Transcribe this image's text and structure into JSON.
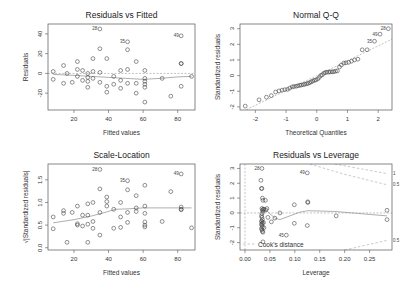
{
  "chart_data": [
    {
      "type": "scatter",
      "title": "Residuals vs Fitted",
      "xlabel": "Fitted values",
      "ylabel": "Residuals",
      "xlim": [
        5,
        90
      ],
      "ylim": [
        -37,
        50
      ],
      "xticks": [
        20,
        40,
        60,
        80
      ],
      "yticks": [
        -20,
        0,
        20,
        40
      ],
      "box": {
        "x": 48,
        "y": 24,
        "w": 147,
        "h": 86
      },
      "points": [
        [
          8,
          2
        ],
        [
          8,
          -6
        ],
        [
          14,
          8
        ],
        [
          14,
          -10
        ],
        [
          16,
          0
        ],
        [
          19,
          -9
        ],
        [
          22,
          12
        ],
        [
          22,
          4
        ],
        [
          22,
          -3
        ],
        [
          25,
          3
        ],
        [
          25,
          -7
        ],
        [
          28,
          0
        ],
        [
          28,
          -4
        ],
        [
          28,
          -8
        ],
        [
          28,
          -14
        ],
        [
          31,
          15
        ],
        [
          31,
          2
        ],
        [
          31,
          -5
        ],
        [
          35,
          25
        ],
        [
          35,
          1
        ],
        [
          35,
          -9
        ],
        [
          35,
          45
        ],
        [
          39,
          15
        ],
        [
          39,
          -13
        ],
        [
          39,
          -19
        ],
        [
          43,
          -3
        ],
        [
          43,
          -11
        ],
        [
          47,
          3
        ],
        [
          47,
          -7
        ],
        [
          47,
          -15
        ],
        [
          51,
          24
        ],
        [
          51,
          4
        ],
        [
          51,
          -10
        ],
        [
          51,
          32
        ],
        [
          56,
          12
        ],
        [
          56,
          -10
        ],
        [
          56,
          -20
        ],
        [
          61,
          3
        ],
        [
          61,
          -5
        ],
        [
          61,
          -8
        ],
        [
          61,
          -11
        ],
        [
          61,
          -14
        ],
        [
          61,
          -29
        ],
        [
          71,
          -5
        ],
        [
          76,
          -23
        ],
        [
          82,
          38
        ],
        [
          82,
          10
        ],
        [
          82,
          10
        ],
        [
          82,
          -13
        ],
        [
          88,
          -3
        ]
      ],
      "labels": [
        {
          "text": "28",
          "x": 35,
          "y": 45
        },
        {
          "text": "35",
          "x": 51,
          "y": 32
        },
        {
          "text": "49",
          "x": 82,
          "y": 38
        }
      ],
      "smooth": [
        [
          8,
          -1
        ],
        [
          20,
          -2
        ],
        [
          30,
          -3
        ],
        [
          40,
          -4
        ],
        [
          50,
          -5
        ],
        [
          60,
          -6
        ],
        [
          70,
          -5
        ],
        [
          80,
          -3.5
        ],
        [
          88,
          -3
        ]
      ],
      "refline": 0
    },
    {
      "type": "scatter",
      "title": "Normal Q-Q",
      "xlabel": "Theoretical Quantiles",
      "ylabel": "Standardized residuals",
      "xlim": [
        -2.5,
        2.45
      ],
      "ylim": [
        -2.2,
        3.3
      ],
      "xticks": [
        -2,
        -1,
        0,
        1,
        2
      ],
      "yticks": [
        -2,
        -1,
        0,
        1,
        2,
        3
      ],
      "box": {
        "x": 240,
        "y": 24,
        "w": 152,
        "h": 86
      },
      "points": [
        [
          -2.33,
          -1.95
        ],
        [
          -1.88,
          -1.55
        ],
        [
          -1.64,
          -1.38
        ],
        [
          -1.48,
          -1.28
        ],
        [
          -1.34,
          -1.05
        ],
        [
          -1.23,
          -0.98
        ],
        [
          -1.13,
          -0.93
        ],
        [
          -1.04,
          -0.9
        ],
        [
          -0.95,
          -0.88
        ],
        [
          -0.88,
          -0.8
        ],
        [
          -0.8,
          -0.72
        ],
        [
          -0.74,
          -0.7
        ],
        [
          -0.67,
          -0.68
        ],
        [
          -0.61,
          -0.65
        ],
        [
          -0.55,
          -0.62
        ],
        [
          -0.5,
          -0.6
        ],
        [
          -0.44,
          -0.58
        ],
        [
          -0.39,
          -0.55
        ],
        [
          -0.33,
          -0.52
        ],
        [
          -0.28,
          -0.5
        ],
        [
          -0.23,
          -0.45
        ],
        [
          -0.18,
          -0.4
        ],
        [
          -0.13,
          -0.35
        ],
        [
          -0.08,
          -0.3
        ],
        [
          -0.03,
          -0.28
        ],
        [
          0.03,
          -0.22
        ],
        [
          0.08,
          -0.12
        ],
        [
          0.13,
          0.0
        ],
        [
          0.18,
          0.05
        ],
        [
          0.23,
          0.15
        ],
        [
          0.28,
          0.2
        ],
        [
          0.33,
          0.22
        ],
        [
          0.39,
          0.22
        ],
        [
          0.44,
          0.24
        ],
        [
          0.5,
          0.24
        ],
        [
          0.55,
          0.25
        ],
        [
          0.61,
          0.28
        ],
        [
          0.67,
          0.3
        ],
        [
          0.74,
          0.55
        ],
        [
          0.8,
          0.68
        ],
        [
          0.88,
          0.8
        ],
        [
          0.95,
          0.82
        ],
        [
          1.04,
          0.85
        ],
        [
          1.13,
          0.92
        ],
        [
          1.23,
          1.0
        ],
        [
          1.34,
          1.05
        ],
        [
          1.48,
          1.65
        ],
        [
          1.64,
          1.65
        ],
        [
          1.88,
          2.2
        ],
        [
          2.06,
          2.65
        ],
        [
          2.33,
          3.0
        ]
      ],
      "labels": [
        {
          "text": "35",
          "x": 1.88,
          "y": 2.2
        },
        {
          "text": "49",
          "x": 2.06,
          "y": 2.65
        },
        {
          "text": "28",
          "x": 2.33,
          "y": 3.0
        }
      ],
      "refline": "qq"
    },
    {
      "type": "scatter",
      "title": "Scale-Location",
      "xlabel": "Fitted values",
      "ylabel": "√|Standardized residuals|",
      "xlim": [
        5,
        90
      ],
      "ylim": [
        -0.05,
        1.85
      ],
      "xticks": [
        20,
        40,
        60,
        80
      ],
      "yticks": [
        0.0,
        0.5,
        1.0,
        1.5
      ],
      "box": {
        "x": 48,
        "y": 164,
        "w": 147,
        "h": 86
      },
      "points": [
        [
          8,
          0.68
        ],
        [
          8,
          0.42
        ],
        [
          14,
          0.82
        ],
        [
          14,
          0.76
        ],
        [
          16,
          0.12
        ],
        [
          19,
          0.78
        ],
        [
          22,
          0.92
        ],
        [
          22,
          0.53
        ],
        [
          22,
          0.5
        ],
        [
          25,
          0.72
        ],
        [
          25,
          0.48
        ],
        [
          28,
          0.97
        ],
        [
          28,
          0.72
        ],
        [
          28,
          0.52
        ],
        [
          28,
          0.12
        ],
        [
          31,
          1.0
        ],
        [
          31,
          0.58
        ],
        [
          31,
          0.43
        ],
        [
          35,
          1.3
        ],
        [
          35,
          0.78
        ],
        [
          35,
          0.28
        ],
        [
          35,
          1.73
        ],
        [
          39,
          1.12
        ],
        [
          39,
          1.02
        ],
        [
          39,
          0.92
        ],
        [
          43,
          0.85
        ],
        [
          43,
          0.43
        ],
        [
          47,
          1.0
        ],
        [
          47,
          0.68
        ],
        [
          47,
          0.45
        ],
        [
          51,
          1.28
        ],
        [
          51,
          0.78
        ],
        [
          51,
          0.56
        ],
        [
          51,
          1.48
        ],
        [
          56,
          1.15
        ],
        [
          56,
          0.88
        ],
        [
          56,
          0.8
        ],
        [
          61,
          1.38
        ],
        [
          61,
          0.92
        ],
        [
          61,
          0.76
        ],
        [
          61,
          0.57
        ],
        [
          61,
          0.5
        ],
        [
          61,
          0.46
        ],
        [
          71,
          0.58
        ],
        [
          76,
          1.24
        ],
        [
          82,
          1.63
        ],
        [
          82,
          0.9
        ],
        [
          82,
          0.85
        ],
        [
          82,
          0.84
        ],
        [
          88,
          0.44
        ]
      ],
      "labels": [
        {
          "text": "28",
          "x": 35,
          "y": 1.73
        },
        {
          "text": "35",
          "x": 51,
          "y": 1.48
        },
        {
          "text": "49",
          "x": 82,
          "y": 1.63
        }
      ],
      "smooth": [
        [
          8,
          0.55
        ],
        [
          20,
          0.62
        ],
        [
          30,
          0.7
        ],
        [
          38,
          0.78
        ],
        [
          44,
          0.85
        ],
        [
          52,
          0.86
        ],
        [
          60,
          0.88
        ],
        [
          70,
          0.88
        ],
        [
          80,
          0.88
        ],
        [
          88,
          0.88
        ]
      ]
    },
    {
      "type": "scatter",
      "title": "Residuals vs Leverage",
      "xlabel": "Leverage",
      "ylabel": "Standardized residuals",
      "xlim": [
        -0.01,
        0.295
      ],
      "ylim": [
        -2.5,
        3.3
      ],
      "xticks": [
        0.0,
        0.05,
        0.1,
        0.15,
        0.2,
        0.25
      ],
      "yticks": [
        -2,
        -1,
        0,
        1,
        2,
        3
      ],
      "box": {
        "x": 240,
        "y": 164,
        "w": 152,
        "h": 86
      },
      "points": [
        [
          0.034,
          3.0
        ],
        [
          0.032,
          2.2
        ],
        [
          0.033,
          1.65
        ],
        [
          0.034,
          1.65
        ],
        [
          0.035,
          1.0
        ],
        [
          0.036,
          0.85
        ],
        [
          0.034,
          0.3
        ],
        [
          0.035,
          0.2
        ],
        [
          0.036,
          0.1
        ],
        [
          0.037,
          0.25
        ],
        [
          0.038,
          0.25
        ],
        [
          0.034,
          -0.05
        ],
        [
          0.033,
          -0.2
        ],
        [
          0.034,
          -0.3
        ],
        [
          0.035,
          -0.45
        ],
        [
          0.033,
          -0.55
        ],
        [
          0.034,
          -0.6
        ],
        [
          0.035,
          -0.7
        ],
        [
          0.033,
          -0.75
        ],
        [
          0.034,
          -0.85
        ],
        [
          0.035,
          -0.95
        ],
        [
          0.033,
          -1.05
        ],
        [
          0.034,
          -1.15
        ],
        [
          0.035,
          -1.25
        ],
        [
          0.036,
          -1.3
        ],
        [
          0.037,
          -0.65
        ],
        [
          0.038,
          -1.0
        ],
        [
          0.036,
          -1.95
        ],
        [
          0.041,
          0.85
        ],
        [
          0.042,
          0.2
        ],
        [
          0.044,
          0.3
        ],
        [
          0.046,
          -0.3
        ],
        [
          0.053,
          -0.6
        ],
        [
          0.06,
          -0.35
        ],
        [
          0.07,
          0.0
        ],
        [
          0.083,
          -1.5
        ],
        [
          0.099,
          0.55
        ],
        [
          0.099,
          -0.7
        ],
        [
          0.125,
          2.7
        ],
        [
          0.126,
          0.75
        ],
        [
          0.126,
          0.7
        ],
        [
          0.125,
          -0.85
        ],
        [
          0.183,
          -0.2
        ],
        [
          0.285,
          0.18
        ],
        [
          0.285,
          -0.45
        ]
      ],
      "labels": [
        {
          "text": "28",
          "x": 0.034,
          "y": 3.0
        },
        {
          "text": "49",
          "x": 0.125,
          "y": 2.7
        },
        {
          "text": "45",
          "x": 0.083,
          "y": -1.5
        }
      ],
      "smooth": [
        [
          0.033,
          0.2
        ],
        [
          0.045,
          0.1
        ],
        [
          0.06,
          -0.35
        ],
        [
          0.07,
          -0.45
        ],
        [
          0.09,
          -0.2
        ],
        [
          0.11,
          0.05
        ],
        [
          0.126,
          0.15
        ],
        [
          0.18,
          0.1
        ],
        [
          0.285,
          -0.2
        ]
      ],
      "cooks_distance": [
        {
          "level": "1",
          "upper": [
            [
              0.18,
              3.3
            ],
            [
              0.285,
              2.65
            ]
          ],
          "lower": []
        },
        {
          "level": "0.5",
          "upper": [
            [
              0.13,
              3.3
            ],
            [
              0.2,
              2.6
            ],
            [
              0.285,
              1.9
            ]
          ],
          "lower": [
            [
              0.2,
              -2.5
            ],
            [
              0.285,
              -1.85
            ]
          ]
        }
      ],
      "legend": {
        "text": "Cook's distance",
        "position": "bottomleft"
      }
    }
  ]
}
